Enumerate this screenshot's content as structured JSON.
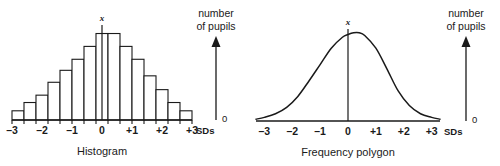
{
  "figure": {
    "background_color": "#ffffff",
    "ink_color": "#1a1a1a"
  },
  "panels": [
    {
      "id": "histogram",
      "caption": "Histogram",
      "mean_marker": "x",
      "x_axis": {
        "unit_label": "SDs",
        "tick_labels": [
          "–3",
          "–2",
          "–1",
          "0",
          "+1",
          "+2",
          "+3"
        ],
        "tick_values": [
          -3,
          -2,
          -1,
          0,
          1,
          2,
          3
        ],
        "min": -3,
        "max": 3
      },
      "y_axis": {
        "title_line1": "number",
        "title_line2": "of pupils",
        "origin_label": "0"
      }
    },
    {
      "id": "frequency-polygon",
      "caption": "Frequency polygon",
      "mean_marker": "x",
      "x_axis": {
        "unit_label": "SDs",
        "tick_labels": [
          "–3",
          "–2",
          "–1",
          "0",
          "+1",
          "+2",
          "+3"
        ],
        "tick_values": [
          -3,
          -2,
          -1,
          0,
          1,
          2,
          3
        ],
        "min": -3,
        "max": 3
      },
      "y_axis": {
        "title_line1": "number",
        "title_line2": "of pupils",
        "origin_label": "0"
      }
    }
  ],
  "chart_data": [
    {
      "type": "bar",
      "id": "histogram",
      "title": "Histogram",
      "xlabel": "SDs",
      "ylabel": "number of pupils",
      "grid": false,
      "legend": false,
      "xlim": [
        -3,
        3
      ],
      "ylim": [
        0,
        100
      ],
      "bin_width_sd": 0.4,
      "categories": [
        "-3.0 to -2.6",
        "-2.6 to -2.2",
        "-2.2 to -1.8",
        "-1.8 to -1.4",
        "-1.4 to -1.0",
        "-1.0 to -0.6",
        "-0.6 to -0.2",
        "-0.2 to +0.2",
        "+0.2 to +0.6",
        "+0.6 to +1.0",
        "+1.0 to +1.4",
        "+1.4 to +1.8",
        "+1.8 to +2.2",
        "+2.2 to +2.6",
        "+2.6 to +3.0"
      ],
      "bin_centers": [
        -2.8,
        -2.4,
        -2.0,
        -1.6,
        -1.2,
        -0.8,
        -0.4,
        0.0,
        0.4,
        0.8,
        1.2,
        1.6,
        2.0,
        2.4,
        2.8
      ],
      "values": [
        10,
        19,
        27,
        41,
        54,
        66,
        80,
        94,
        94,
        80,
        66,
        48,
        33,
        19,
        10
      ],
      "annotations": [
        {
          "text": "x",
          "x": 0.0,
          "note": "mean marker above tallest bar with vertical line to baseline"
        }
      ]
    },
    {
      "type": "line",
      "id": "frequency-polygon",
      "title": "Frequency polygon",
      "xlabel": "SDs",
      "ylabel": "number of pupils",
      "grid": false,
      "legend": false,
      "xlim": [
        -3.3,
        3.3
      ],
      "ylim": [
        0,
        100
      ],
      "curve": "normal distribution (bell curve)",
      "x": [
        -3.3,
        -3.0,
        -2.6,
        -2.2,
        -1.8,
        -1.4,
        -1.0,
        -0.6,
        -0.2,
        0.0,
        0.2,
        0.4,
        0.6,
        1.0,
        1.4,
        1.8,
        2.2,
        2.6,
        3.0,
        3.3
      ],
      "values": [
        2,
        4,
        8,
        15,
        27,
        44,
        62,
        80,
        92,
        95,
        97,
        97,
        94,
        80,
        57,
        33,
        17,
        8,
        4,
        2
      ],
      "annotations": [
        {
          "text": "x",
          "x": 0.0,
          "note": "mean marker at curve peak with vertical line to baseline"
        }
      ]
    }
  ]
}
